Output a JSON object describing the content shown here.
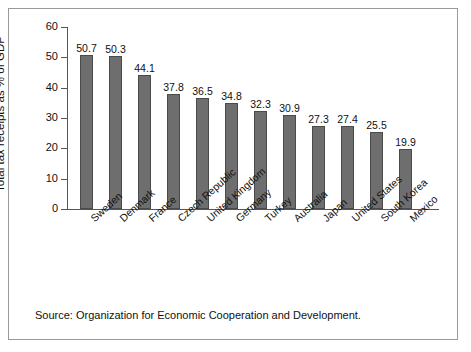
{
  "chart_data": {
    "type": "bar",
    "title": "",
    "subtitle": "",
    "xlabel": "",
    "ylabel": "Total tax receipts as % of GDP",
    "ylim": [
      0,
      60
    ],
    "yticks": [
      0,
      10,
      20,
      30,
      40,
      50,
      60
    ],
    "grid": false,
    "legend": "none",
    "bar_color": "#6e6e6e",
    "categories": [
      "Sweden",
      "Denmark",
      "France",
      "Czech Republic",
      "United Kingdom",
      "Germany",
      "Turkey",
      "Australia",
      "Japan",
      "United States",
      "South Korea",
      "Mexico"
    ],
    "values": [
      50.7,
      50.3,
      44.1,
      37.8,
      36.5,
      34.8,
      32.3,
      30.9,
      27.3,
      27.4,
      25.5,
      19.9
    ],
    "value_labels": [
      "50.7",
      "50.3",
      "44.1",
      "37.8",
      "36.5",
      "34.8",
      "32.3",
      "30.9",
      "27.3",
      "27.4",
      "25.5",
      "19.9"
    ],
    "annotations": []
  },
  "footer": {
    "source": "Source: Organization for Economic Cooperation and Development."
  }
}
